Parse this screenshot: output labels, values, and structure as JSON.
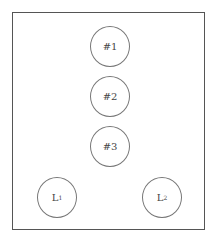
{
  "diagram": {
    "nodes": [
      {
        "id": "n1",
        "label": "#1"
      },
      {
        "id": "n2",
        "label": "#2"
      },
      {
        "id": "n3",
        "label": "#3"
      },
      {
        "id": "l1",
        "label": "L",
        "sub": "1"
      },
      {
        "id": "l2",
        "label": "L",
        "sub": "2"
      }
    ]
  }
}
